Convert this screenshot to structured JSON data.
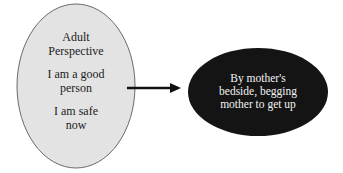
{
  "diagram": {
    "left_node": {
      "lines": [
        "Adult",
        "Perspective",
        "I am a good",
        "person",
        "I am safe",
        "now"
      ],
      "fill": "#e3e3e3",
      "stroke": "#6a6a6a"
    },
    "arrow": {
      "direction": "right",
      "color": "#111111"
    },
    "right_node": {
      "lines": [
        "By mother's",
        "bedside, begging",
        "mother to get up"
      ],
      "fill": "#141414",
      "text_color": "#f2f2f2"
    }
  }
}
